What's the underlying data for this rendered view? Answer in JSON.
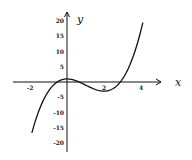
{
  "chart_data": {
    "type": "line",
    "title": "",
    "function": "y = x^3 - 3x^2 + 1",
    "xlabel": "x",
    "ylabel": "y",
    "xlim": [
      -3,
      4.5
    ],
    "ylim": [
      -20,
      20
    ],
    "x_ticks": [
      -2,
      2,
      4
    ],
    "y_ticks": [
      20,
      15,
      10,
      5,
      -5,
      -10,
      -15,
      -20
    ],
    "x_tick_labels": [
      "-2",
      "2",
      "4"
    ],
    "y_tick_labels": [
      "20",
      "15",
      "10",
      "5",
      "-5",
      "-10",
      "-15",
      "-20"
    ],
    "grid": false,
    "legend": null,
    "series": [
      {
        "name": "curve",
        "x": [
          -1.9,
          -1.5,
          -1,
          -0.5,
          0,
          0.5,
          1,
          1.5,
          2,
          2.5,
          3,
          3.5,
          4,
          4.1
        ],
        "y": [
          -16.7,
          -8.1,
          -3,
          0.1,
          1,
          0.4,
          -1,
          -2.4,
          -3,
          -2.1,
          1,
          6.1,
          17,
          18.5
        ]
      }
    ],
    "annotations": {
      "local_max": [
        0,
        1
      ],
      "local_min": [
        2,
        -3
      ]
    }
  }
}
